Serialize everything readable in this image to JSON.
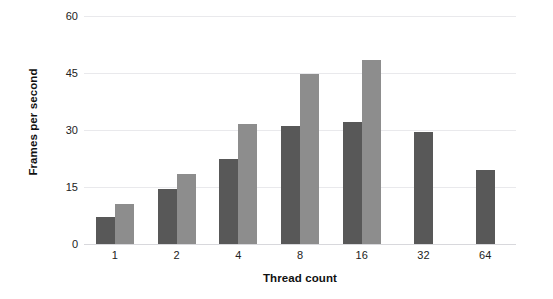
{
  "chart_data": {
    "type": "bar",
    "title": "",
    "xlabel": "Thread count",
    "ylabel": "Frames per second",
    "categories": [
      "1",
      "2",
      "4",
      "8",
      "16",
      "32",
      "64"
    ],
    "series": [
      {
        "name": "series-a",
        "color": "#585858",
        "values": [
          7.0,
          14.5,
          22.5,
          31.0,
          32.0,
          29.5,
          19.5
        ]
      },
      {
        "name": "series-b",
        "color": "#8d8d8d",
        "values": [
          10.5,
          18.5,
          31.5,
          44.8,
          48.5,
          null,
          null
        ]
      }
    ],
    "ylim": [
      0,
      60
    ],
    "yticks": [
      0,
      15,
      30,
      45,
      60
    ],
    "ytick_labels": [
      "0",
      "15",
      "30",
      "45",
      "60"
    ],
    "grid": true,
    "legend": "none",
    "gridline_color": "#e9e9ec",
    "baseline_color": "#d8d8dc",
    "background": "#ffffff"
  }
}
